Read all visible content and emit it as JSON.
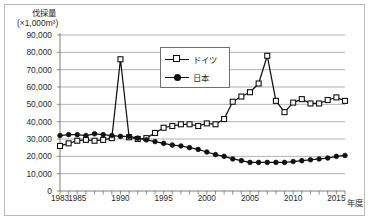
{
  "frame": {
    "border_color": "#b9b9b9"
  },
  "axis_title": {
    "line1": "伐採量",
    "line2": "(×1,000m³)"
  },
  "x_unit_label": "年度",
  "legend": {
    "position": "inside-top-center",
    "entries": [
      {
        "label": "ドイツ",
        "marker": "open-square",
        "color": "#111111"
      },
      {
        "label": "日本",
        "marker": "filled-circle",
        "color": "#111111"
      }
    ]
  },
  "chart_data": {
    "type": "line",
    "title": "伐採量 (×1,000m³)",
    "xlabel": "年度",
    "ylabel": "伐採量（×1,000m³）",
    "xlim": [
      1983,
      2016
    ],
    "ylim": [
      0,
      90000
    ],
    "ytick_step": 10000,
    "grid": true,
    "legend_position": "inside-top-center",
    "ytick_labels": [
      "0",
      "10,000",
      "20,000",
      "30,000",
      "40,000",
      "50,000",
      "60,000",
      "70,000",
      "80,000",
      "90,000"
    ],
    "yticks": [
      0,
      10000,
      20000,
      30000,
      40000,
      50000,
      60000,
      70000,
      80000,
      90000
    ],
    "xtick_labels": [
      "1983",
      "1985",
      "1990",
      "1995",
      "2000",
      "2005",
      "2010",
      "2015"
    ],
    "xticks": [
      1983,
      1985,
      1990,
      1995,
      2000,
      2005,
      2010,
      2015
    ],
    "x": [
      1983,
      1984,
      1985,
      1986,
      1987,
      1988,
      1989,
      1990,
      1991,
      1992,
      1993,
      1994,
      1995,
      1996,
      1997,
      1998,
      1999,
      2000,
      2001,
      2002,
      2003,
      2004,
      2005,
      2006,
      2007,
      2008,
      2009,
      2010,
      2011,
      2012,
      2013,
      2014,
      2015,
      2016
    ],
    "series": [
      {
        "name": "ドイツ",
        "marker": "open-square",
        "color": "#111111",
        "values": [
          26000,
          27500,
          29000,
          29500,
          29000,
          29500,
          30500,
          76000,
          31000,
          30000,
          30500,
          33500,
          36500,
          37500,
          38500,
          38500,
          37500,
          39000,
          38500,
          41500,
          51500,
          54500,
          57000,
          62000,
          78000,
          52000,
          45500,
          51000,
          53000,
          50500,
          50500,
          52500,
          54000,
          52000
        ]
      },
      {
        "name": "日本",
        "marker": "filled-circle",
        "color": "#111111",
        "values": [
          32000,
          32500,
          32500,
          32000,
          33000,
          32500,
          32000,
          31500,
          31500,
          30500,
          29500,
          28500,
          27500,
          26500,
          26000,
          25000,
          24000,
          22500,
          21000,
          20000,
          18500,
          17500,
          16500,
          16500,
          16500,
          16500,
          16500,
          17000,
          17500,
          18000,
          18500,
          19000,
          20000,
          20500
        ]
      }
    ]
  }
}
